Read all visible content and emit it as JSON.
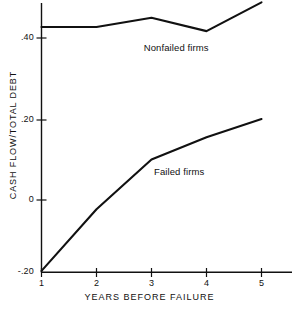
{
  "chart_data": {
    "type": "line",
    "title": "",
    "xlabel": "YEARS BEFORE FAILURE",
    "ylabel": "CASH FLOW/TOTAL DEBT",
    "x": [
      1,
      2,
      3,
      4,
      5
    ],
    "xtick_labels": [
      "1",
      "2",
      "3",
      "4",
      "5"
    ],
    "ytick_values": [
      0.4,
      0.2,
      0,
      -0.2
    ],
    "ytick_labels": [
      ".40",
      ".20",
      "0",
      "-.20"
    ],
    "xlim": [
      1,
      5.35
    ],
    "ylim": [
      -0.2,
      0.5
    ],
    "grid": false,
    "legend_position": "inline-annotation",
    "series": [
      {
        "name": "Nonfailed firms",
        "values": [
          0.427,
          0.427,
          0.45,
          0.417,
          0.488
        ],
        "label_x": 3.45,
        "label_y": 0.375
      },
      {
        "name": "Failed firms",
        "values": [
          -0.175,
          -0.023,
          0.1,
          0.155,
          0.2
        ],
        "label_x": 3.5,
        "label_y": 0.068
      }
    ],
    "annotations": [
      {
        "text": "Nonfailed firms"
      },
      {
        "text": "Failed firms"
      }
    ],
    "colors": {
      "line": "#111111",
      "axis": "#111111",
      "background": "#ffffff"
    }
  }
}
